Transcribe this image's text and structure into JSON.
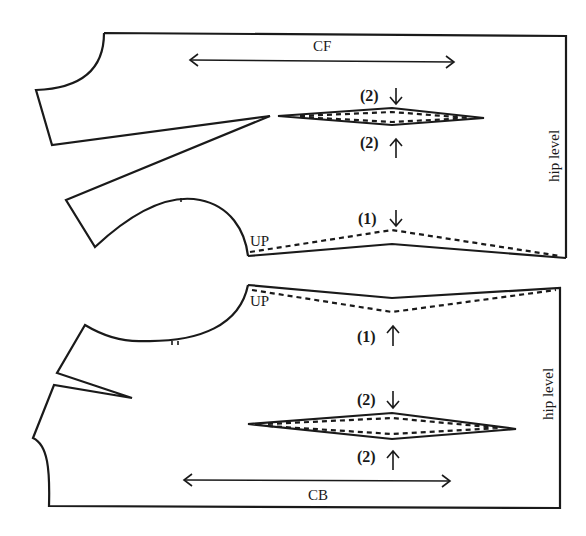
{
  "figure": {
    "front_panel": {
      "grain_label": "CF",
      "side_label": "hip level",
      "armhole_label": "UP",
      "waist_dart_top_marker": "(2)",
      "waist_dart_bottom_marker": "(2)",
      "hem_marker": "(1)"
    },
    "back_panel": {
      "grain_label": "CB",
      "side_label": "hip level",
      "armhole_label": "UP",
      "hem_marker": "(1)",
      "waist_dart_top_marker": "(2)",
      "waist_dart_bottom_marker": "(2)"
    },
    "colors": {
      "line": "#1a1a1a",
      "background": "#ffffff"
    }
  }
}
